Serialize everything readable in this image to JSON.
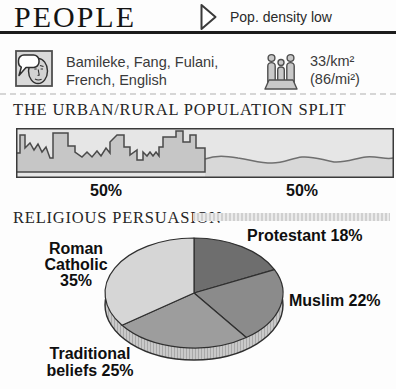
{
  "header": {
    "title": "PEOPLE",
    "tagline": "Pop. density low"
  },
  "facts": {
    "languages": "Bamileke, Fang, Fulani,\nFrench, English",
    "density": "33/km²\n(86/mi²)"
  },
  "urban_rural": {
    "heading": "THE URBAN/RURAL POPULATION SPLIT",
    "urban_label": "50%",
    "rural_label": "50%"
  },
  "religion": {
    "heading": "RELIGIOUS PERSUASION",
    "labels": {
      "protestant": "Protestant 18%",
      "muslim": "Muslim 22%",
      "roman_catholic": "Roman\nCatholic\n35%",
      "traditional": "Traditional\nbeliefs 25%"
    }
  },
  "chart_data": [
    {
      "type": "bar",
      "title": "THE URBAN/RURAL POPULATION SPLIT",
      "categories": [
        "Urban",
        "Rural"
      ],
      "values": [
        50,
        50
      ],
      "unit": "percent",
      "style": "pictorial-strip (city skyline = urban, rolling hills = rural)"
    },
    {
      "type": "pie",
      "title": "RELIGIOUS PERSUASION",
      "labels": [
        "Protestant",
        "Muslim",
        "Traditional beliefs",
        "Roman Catholic"
      ],
      "values": [
        18,
        22,
        25,
        35
      ],
      "colors": [
        "#6e6e6e",
        "#8b8b8b",
        "#9d9d9d",
        "#d6d6d6"
      ],
      "start_angle_deg": 0,
      "direction": "clockwise",
      "style": "3d-ellipse",
      "rim_color": "#c9c9c9"
    }
  ]
}
